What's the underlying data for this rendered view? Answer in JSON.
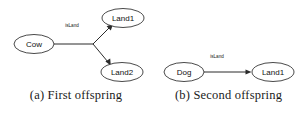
{
  "figures": [
    {
      "id": "first-offspring",
      "caption": "(a) First offspring",
      "nodes": [
        {
          "id": "cow",
          "label": "Cow",
          "cx": 34,
          "cy": 44,
          "rx": 20,
          "ry": 9.5
        },
        {
          "id": "land1",
          "label": "Land1",
          "cx": 123,
          "cy": 18,
          "rx": 21,
          "ry": 9.5
        },
        {
          "id": "land2",
          "label": "Land2",
          "cx": 122,
          "cy": 72,
          "rx": 21,
          "ry": 9.5
        }
      ],
      "edges": [
        {
          "id": "cow-land1",
          "from": "Cow",
          "to": "Land1",
          "label": "isLand",
          "label_x": 72,
          "label_y": 26
        },
        {
          "id": "cow-land2",
          "from": "Cow",
          "to": "Land2",
          "label": "",
          "label_x": 0,
          "label_y": 0
        }
      ]
    },
    {
      "id": "second-offspring",
      "caption": "(b) Second offspring",
      "nodes": [
        {
          "id": "dog",
          "label": "Dog",
          "cx": 32,
          "cy": 72,
          "rx": 20,
          "ry": 9.5
        },
        {
          "id": "land1",
          "label": "Land1",
          "cx": 121,
          "cy": 72,
          "rx": 21,
          "ry": 9.5
        }
      ],
      "edges": [
        {
          "id": "dog-land1",
          "from": "Dog",
          "to": "Land1",
          "label": "isLand",
          "label_x": 65,
          "label_y": 57
        }
      ]
    }
  ],
  "colors": {
    "background": "#ffffff",
    "node_stroke": "#1a1a1a",
    "node_fill": "#ffffff",
    "edge_stroke": "#2b2b2b",
    "text": "#111111",
    "caption_text": "#1a1a1a"
  }
}
